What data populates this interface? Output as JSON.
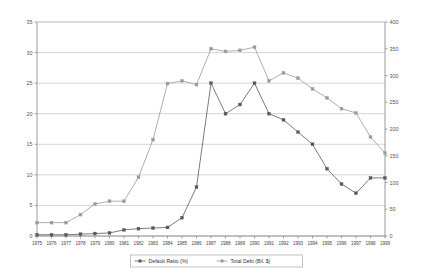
{
  "chart_data": {
    "type": "line",
    "title": "",
    "subtitle": "",
    "xlabel": "",
    "ylabel": "",
    "grid": true,
    "legend_position": "bottom",
    "categories": [
      "1975",
      "1976",
      "1977",
      "1978",
      "1979",
      "1980",
      "1981",
      "1982",
      "1983",
      "1984",
      "1985",
      "1986",
      "1987",
      "1988",
      "1989",
      "1990",
      "1991",
      "1992",
      "1993",
      "1994",
      "1995",
      "1996",
      "1997",
      "1998",
      "1999"
    ],
    "axes": {
      "left": {
        "label": "Default Ratio (%)",
        "min": 0,
        "max": 35,
        "ticks": [
          0,
          5,
          10,
          15,
          20,
          25,
          30,
          35
        ],
        "tick_labels": [
          "0",
          "5",
          "10",
          "15",
          "20",
          "25",
          "30",
          "35"
        ]
      },
      "right": {
        "label": "Total Debt (Bil. $)",
        "min": 0,
        "max": 400,
        "ticks": [
          0,
          50,
          100,
          150,
          200,
          250,
          300,
          350,
          400
        ],
        "tick_labels": [
          "0",
          "50",
          "100",
          "150",
          "200",
          "250",
          "300",
          "350",
          "400"
        ]
      }
    },
    "series": [
      {
        "name": "Default Ratio (%)",
        "axis": "left",
        "color": "#5a5a5a",
        "marker": "square",
        "values": [
          0.2,
          0.2,
          0.2,
          0.3,
          0.4,
          0.5,
          1.0,
          1.2,
          1.3,
          1.4,
          3.0,
          8.0,
          25.0,
          20.0,
          21.5,
          25.0,
          20.0,
          19.0,
          17.0,
          15.0,
          11.0,
          8.5,
          7.0,
          9.5,
          9.5
        ]
      },
      {
        "name": "Total Debt (Bil. $)",
        "axis": "right",
        "color": "#9a9a9a",
        "marker": "square",
        "values": [
          25,
          25,
          25,
          40,
          60,
          65,
          65,
          110,
          180,
          285,
          290,
          283,
          350,
          345,
          347,
          353,
          290,
          305,
          295,
          275,
          258,
          238,
          230,
          185,
          155
        ]
      }
    ],
    "legend": [
      {
        "label": "Default Ratio (%)",
        "color": "#5a5a5a"
      },
      {
        "label": "Total Debt (Bil. $)",
        "color": "#9a9a9a"
      }
    ]
  }
}
